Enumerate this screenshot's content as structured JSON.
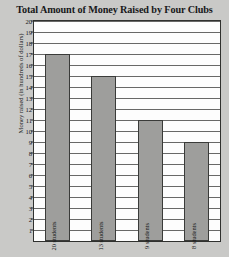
{
  "chart_data": {
    "type": "bar",
    "title": "Total Amount of Money Raised by Four Clubs",
    "xlabel": "",
    "ylabel": "Money raised (in hundreds of dollars)",
    "ylim": [
      0,
      20
    ],
    "ytick_step": 1,
    "grid": true,
    "legend": null,
    "categories": [
      "20 students",
      "13 students",
      "9 students",
      "8 students"
    ],
    "values": [
      17,
      15,
      11,
      9
    ],
    "ytick_labels": [
      "20",
      "19",
      "18",
      "17",
      "16",
      "15",
      "14",
      "13",
      "12",
      "11",
      "10",
      "9",
      "8",
      "7",
      "6",
      "5",
      "4",
      "3",
      "2",
      "1"
    ],
    "bar_color": "#9e9e9c",
    "bar_border_color": "#3a3b39",
    "plot_background": "#fdfdfd",
    "page_background": "#c9c9c7"
  }
}
